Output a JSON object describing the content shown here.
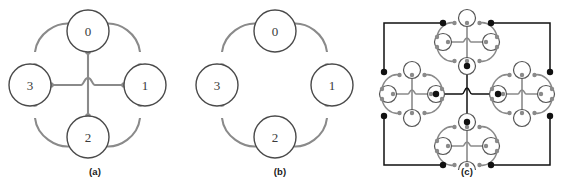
{
  "figure": {
    "background": "#ffffff",
    "width": 564,
    "height": 189
  },
  "style": {
    "inner_link_color": "#8a8a8a",
    "outer_link_color": "#111111",
    "node_fill": "#ffffff",
    "node_stroke": "#4a4a4a",
    "port_color": "#8a8a8a",
    "port_dark_color": "#111111",
    "label_color": "#3a3a3a"
  },
  "panels": [
    {
      "id": "a",
      "caption": "(a)",
      "description": "four-node ring with central crossing links",
      "nodes": [
        {
          "id": "n0",
          "label": "0",
          "cx": 88,
          "cy": 31,
          "r": 21
        },
        {
          "id": "n1",
          "label": "1",
          "cx": 145,
          "cy": 85,
          "r": 21
        },
        {
          "id": "n2",
          "label": "2",
          "cx": 88,
          "cy": 137,
          "r": 21
        },
        {
          "id": "n3",
          "label": "3",
          "cx": 30,
          "cy": 85,
          "r": 21
        }
      ],
      "ring_links": [
        {
          "from": "0",
          "to": "1"
        },
        {
          "from": "1",
          "to": "2"
        },
        {
          "from": "2",
          "to": "3"
        },
        {
          "from": "3",
          "to": "0"
        }
      ],
      "cross_links": [
        {
          "from": "0",
          "to": "2"
        },
        {
          "from": "3",
          "to": "1"
        }
      ],
      "crossing_hop": true,
      "degree": 4
    },
    {
      "id": "b",
      "caption": "(b)",
      "description": "four-node ring without central crossing links",
      "nodes": [
        {
          "id": "n0",
          "label": "0",
          "cx": 85,
          "cy": 31,
          "r": 21
        },
        {
          "id": "n1",
          "label": "1",
          "cx": 142,
          "cy": 85,
          "r": 21
        },
        {
          "id": "n2",
          "label": "2",
          "cx": 85,
          "cy": 137,
          "r": 21
        },
        {
          "id": "n3",
          "label": "3",
          "cx": 27,
          "cy": 85,
          "r": 21
        }
      ],
      "ring_links": [
        {
          "from": "0",
          "to": "1"
        },
        {
          "from": "1",
          "to": "2"
        },
        {
          "from": "2",
          "to": "3"
        },
        {
          "from": "3",
          "to": "0"
        }
      ],
      "cross_links": [],
      "crossing_hop": false,
      "degree": 2
    },
    {
      "id": "c",
      "caption": "(c)",
      "description": "level-2 recursive network: four copies of structure (a) joined by outer-level links in the same cross pattern",
      "clusters": [
        {
          "id": "cluster-top",
          "label": "0",
          "cx": 97,
          "cy": 42
        },
        {
          "id": "cluster-right",
          "label": "1",
          "cx": 152,
          "cy": 94
        },
        {
          "id": "cluster-bottom",
          "label": "2",
          "cx": 97,
          "cy": 146
        },
        {
          "id": "cluster-left",
          "label": "3",
          "cx": 42,
          "cy": 94
        }
      ],
      "outer_ring_links": [
        {
          "from": "0",
          "to": "1"
        },
        {
          "from": "1",
          "to": "2"
        },
        {
          "from": "2",
          "to": "3"
        },
        {
          "from": "3",
          "to": "0"
        }
      ],
      "outer_cross_links": [
        {
          "from": "0",
          "to": "2"
        },
        {
          "from": "3",
          "to": "1"
        }
      ],
      "crossing_hop": true,
      "sub_node_count": 4,
      "total_nodes": 16
    }
  ]
}
